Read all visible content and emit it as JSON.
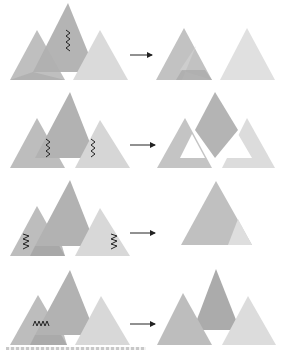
{
  "figure": {
    "colors": {
      "dark": "#a8a8a8",
      "mid": "#bdbdbd",
      "light": "#d6d6d6",
      "lighter": "#e4e4e4",
      "overlap": "#9c9c9c",
      "mark": "#222222",
      "arrow": "#222222"
    },
    "rows": [
      {
        "id": 1,
        "before": "three overlapping triangles, zigzag on center triangle",
        "after": "two separate triangles"
      },
      {
        "id": 2,
        "before": "three overlapping triangles, zigzags on left and right overlaps",
        "after": "center triangle with hollowed side triangles"
      },
      {
        "id": 3,
        "before": "three overlapping triangles, zigzags on left and right triangles",
        "after": "single triangle"
      },
      {
        "id": 4,
        "before": "three overlapping triangles, horizontal zigzag on left triangle",
        "after": "three overlapping triangles reordered"
      }
    ],
    "caption": ""
  }
}
